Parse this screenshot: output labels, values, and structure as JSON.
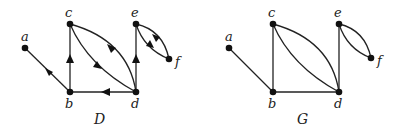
{
  "figure": {
    "graphs": [
      {
        "id": "D",
        "caption": "D",
        "directed": true,
        "nodes": [
          {
            "id": "a",
            "label": "a"
          },
          {
            "id": "b",
            "label": "b"
          },
          {
            "id": "c",
            "label": "c"
          },
          {
            "id": "d",
            "label": "d"
          },
          {
            "id": "e",
            "label": "e"
          },
          {
            "id": "f",
            "label": "f"
          }
        ],
        "edges": [
          {
            "from": "b",
            "to": "a"
          },
          {
            "from": "b",
            "to": "c"
          },
          {
            "from": "d",
            "to": "b"
          },
          {
            "from": "c",
            "to": "d"
          },
          {
            "from": "d",
            "to": "c"
          },
          {
            "from": "d",
            "to": "e"
          },
          {
            "from": "e",
            "to": "f"
          },
          {
            "from": "f",
            "to": "e"
          }
        ]
      },
      {
        "id": "G",
        "caption": "G",
        "directed": false,
        "nodes": [
          {
            "id": "a",
            "label": "a"
          },
          {
            "id": "b",
            "label": "b"
          },
          {
            "id": "c",
            "label": "c"
          },
          {
            "id": "d",
            "label": "d"
          },
          {
            "id": "e",
            "label": "e"
          },
          {
            "id": "f",
            "label": "f"
          }
        ],
        "edges": [
          {
            "from": "a",
            "to": "b"
          },
          {
            "from": "b",
            "to": "c"
          },
          {
            "from": "b",
            "to": "d"
          },
          {
            "from": "c",
            "to": "d"
          },
          {
            "from": "c",
            "to": "d"
          },
          {
            "from": "d",
            "to": "e"
          },
          {
            "from": "e",
            "to": "f"
          },
          {
            "from": "e",
            "to": "f"
          }
        ]
      }
    ]
  }
}
